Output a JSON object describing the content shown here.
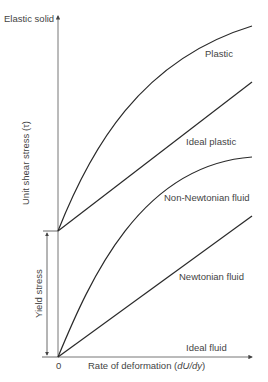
{
  "diagram": {
    "type": "rheology-shear-stress-vs-deformation-rate",
    "y_axis": {
      "label": "Unit shear stress (τ)",
      "top_label": "Elastic solid"
    },
    "x_axis": {
      "label_prefix": "Rate of deformation (",
      "label_math": "dU/dy",
      "label_suffix": ")",
      "origin_label": "0",
      "end_label": "Ideal fluid"
    },
    "yield": {
      "label": "Yield stress"
    },
    "curves": [
      {
        "id": "plastic",
        "label": "Plastic",
        "shape": "concave curve from yield stress"
      },
      {
        "id": "ideal-plastic",
        "label": "Ideal plastic",
        "shape": "straight line from yield stress"
      },
      {
        "id": "non-newtonian",
        "label": "Non-Newtonian fluid",
        "shape": "concave curve from origin"
      },
      {
        "id": "newtonian",
        "label": "Newtonian fluid",
        "shape": "straight line from origin"
      }
    ]
  }
}
